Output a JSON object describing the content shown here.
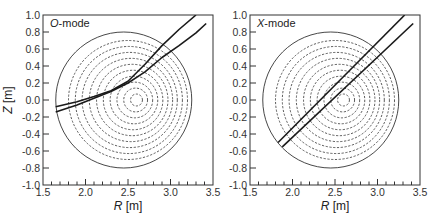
{
  "chart_data": [
    {
      "type": "line",
      "title": "",
      "panel_label": "O-mode",
      "panel_label_italic": "O",
      "panel_label_rest": "-mode",
      "xlabel": "R [m]",
      "xlabel_var": "R",
      "xlabel_unit": " [m]",
      "ylabel": "Z [m]",
      "ylabel_var": "Z",
      "ylabel_unit": " [m]",
      "xlim": [
        1.5,
        3.5
      ],
      "ylim": [
        -1.0,
        1.0
      ],
      "x_ticks": [
        "1.5",
        "2.0",
        "2.5",
        "3.0",
        "3.5"
      ],
      "y_ticks": [
        "1.0",
        "0.8",
        "0.6",
        "0.4",
        "0.2",
        "0.0",
        "-0.2",
        "-0.4",
        "-0.6",
        "-0.8",
        "-1.0"
      ],
      "grid": false,
      "boundary": {
        "r0": 2.45,
        "z0": 0.0,
        "radius": 0.8,
        "style": "solid"
      },
      "flux_surfaces": [
        {
          "r0": 2.5,
          "radius": 0.7
        },
        {
          "r0": 2.51,
          "radius": 0.63
        },
        {
          "r0": 2.52,
          "radius": 0.56
        },
        {
          "r0": 2.535,
          "radius": 0.49
        },
        {
          "r0": 2.55,
          "radius": 0.42
        },
        {
          "r0": 2.56,
          "radius": 0.35
        },
        {
          "r0": 2.57,
          "radius": 0.28
        },
        {
          "r0": 2.58,
          "radius": 0.21
        },
        {
          "r0": 2.59,
          "radius": 0.14
        },
        {
          "r0": 2.6,
          "radius": 0.07
        }
      ],
      "series": [
        {
          "name": "ray-1",
          "points": [
            [
              1.65,
              -0.08
            ],
            [
              1.9,
              -0.02
            ],
            [
              2.1,
              0.04
            ],
            [
              2.3,
              0.11
            ],
            [
              2.5,
              0.22
            ],
            [
              2.7,
              0.42
            ],
            [
              2.9,
              0.64
            ],
            [
              3.1,
              0.83
            ],
            [
              3.3,
              1.0
            ]
          ]
        },
        {
          "name": "ray-2",
          "points": [
            [
              1.65,
              -0.14
            ],
            [
              1.9,
              -0.06
            ],
            [
              2.1,
              0.02
            ],
            [
              2.3,
              0.1
            ],
            [
              2.5,
              0.2
            ],
            [
              2.7,
              0.33
            ],
            [
              2.9,
              0.5
            ],
            [
              3.1,
              0.64
            ],
            [
              3.3,
              0.79
            ],
            [
              3.42,
              0.9
            ]
          ]
        }
      ]
    },
    {
      "type": "line",
      "title": "",
      "panel_label": "X-mode",
      "panel_label_italic": "X",
      "panel_label_rest": "-mode",
      "xlabel": "R [m]",
      "xlabel_var": "R",
      "xlabel_unit": " [m]",
      "xlim": [
        1.5,
        3.5
      ],
      "ylim": [
        -1.0,
        1.0
      ],
      "x_ticks": [
        "1.5",
        "2.0",
        "2.5",
        "3.0",
        "3.5"
      ],
      "y_ticks": [
        "1.0",
        "0.8",
        "0.6",
        "0.4",
        "0.2",
        "0.0",
        "-0.2",
        "-0.4",
        "-0.6",
        "-0.8",
        "-1.0"
      ],
      "grid": false,
      "boundary": {
        "r0": 2.45,
        "z0": 0.0,
        "radius": 0.8,
        "style": "solid"
      },
      "series": [
        {
          "name": "ray-1",
          "points": [
            [
              1.83,
              -0.5
            ],
            [
              3.32,
              1.0
            ]
          ]
        },
        {
          "name": "ray-2",
          "points": [
            [
              1.88,
              -0.55
            ],
            [
              3.42,
              0.9
            ]
          ]
        }
      ]
    }
  ]
}
